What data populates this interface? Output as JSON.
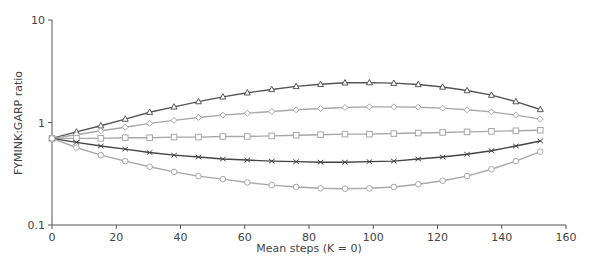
{
  "chart_data": {
    "type": "line",
    "title": "",
    "xlabel": "Mean steps (K = 0)",
    "ylabel": "FYMINK:GARP ratio",
    "yscale": "log",
    "xlim": [
      0,
      160
    ],
    "ylim": [
      0.1,
      10
    ],
    "xticks": [
      0,
      20,
      40,
      60,
      80,
      100,
      120,
      140,
      160
    ],
    "yticks": [
      0.1,
      1,
      10
    ],
    "ytick_labels": [
      "0.1",
      "1",
      "10"
    ],
    "grid": false,
    "legend": "none",
    "x": [
      0,
      7.6,
      15.2,
      22.8,
      30.4,
      38,
      45.6,
      53.2,
      60.8,
      68.4,
      76,
      83.6,
      91.2,
      98.8,
      106.4,
      114,
      121.6,
      129.2,
      136.8,
      144.4,
      152
    ],
    "series": [
      {
        "name": "triangle",
        "marker": "triangle",
        "color": "#555555",
        "values": [
          0.7,
          0.81,
          0.93,
          1.08,
          1.26,
          1.42,
          1.6,
          1.78,
          1.95,
          2.1,
          2.25,
          2.36,
          2.44,
          2.45,
          2.42,
          2.35,
          2.22,
          2.05,
          1.85,
          1.6,
          1.34
        ]
      },
      {
        "name": "diamond",
        "marker": "diamond",
        "color": "#a8a8a8",
        "values": [
          0.7,
          0.76,
          0.83,
          0.9,
          0.98,
          1.05,
          1.12,
          1.18,
          1.23,
          1.28,
          1.33,
          1.37,
          1.4,
          1.42,
          1.42,
          1.41,
          1.38,
          1.33,
          1.27,
          1.18,
          1.08
        ]
      },
      {
        "name": "square",
        "marker": "square",
        "color": "#a8a8a8",
        "values": [
          0.7,
          0.7,
          0.7,
          0.71,
          0.71,
          0.72,
          0.72,
          0.73,
          0.73,
          0.74,
          0.75,
          0.76,
          0.77,
          0.77,
          0.78,
          0.79,
          0.8,
          0.81,
          0.82,
          0.83,
          0.84
        ]
      },
      {
        "name": "cross",
        "marker": "x",
        "color": "#444444",
        "values": [
          0.7,
          0.64,
          0.59,
          0.55,
          0.51,
          0.48,
          0.46,
          0.44,
          0.43,
          0.42,
          0.415,
          0.41,
          0.41,
          0.415,
          0.42,
          0.44,
          0.46,
          0.49,
          0.53,
          0.59,
          0.66
        ]
      },
      {
        "name": "circle",
        "marker": "circle",
        "color": "#a8a8a8",
        "values": [
          0.7,
          0.57,
          0.48,
          0.42,
          0.37,
          0.33,
          0.3,
          0.28,
          0.26,
          0.245,
          0.235,
          0.228,
          0.226,
          0.228,
          0.235,
          0.25,
          0.27,
          0.3,
          0.35,
          0.42,
          0.52
        ]
      }
    ]
  },
  "axis": {
    "xlabel": "Mean steps (K = 0)",
    "ylabel": "FYMINK:GARP ratio"
  }
}
